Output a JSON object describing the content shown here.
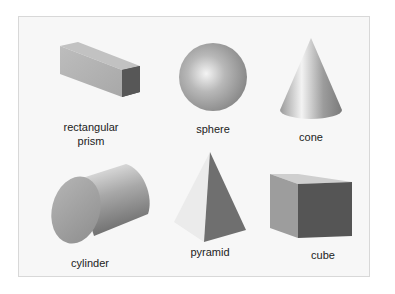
{
  "figure": {
    "shapes": [
      {
        "id": "rectangular-prism",
        "label_line1": "rectangular",
        "label_line2": "prism"
      },
      {
        "id": "sphere",
        "label": "sphere"
      },
      {
        "id": "cone",
        "label": "cone"
      },
      {
        "id": "cylinder",
        "label": "cylinder"
      },
      {
        "id": "pyramid",
        "label": "pyramid"
      },
      {
        "id": "cube",
        "label": "cube"
      }
    ],
    "colors": {
      "background": "#f7f7f7",
      "border": "#d8d8d8",
      "shape_light": "#d9d9d9",
      "shape_mid": "#a0a0a0",
      "shape_dark": "#555555"
    }
  }
}
